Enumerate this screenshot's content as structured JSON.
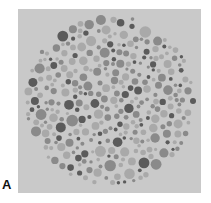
{
  "figure": {
    "panel_label": "A",
    "background_color": "#c9c9c9",
    "plate": {
      "cx": 110,
      "cy": 100,
      "r": 86
    },
    "dot_colors": {
      "dark": "#5b5b5b",
      "mid": "#8a8a8a",
      "light": "#a9a9a9"
    }
  }
}
